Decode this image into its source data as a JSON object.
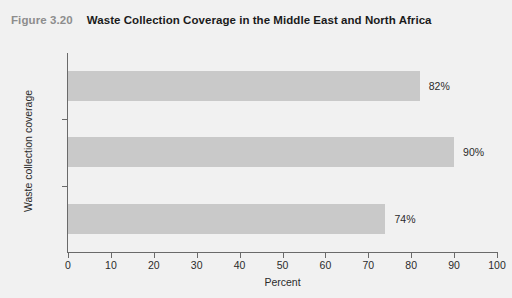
{
  "figure": {
    "number_label": "Figure 3.20",
    "title": "Waste Collection Coverage in the Middle East and North Africa"
  },
  "colors": {
    "bar_fill": "#c9c9c9",
    "axis": "#6a6a6a",
    "page_background": "#f1f1f1",
    "figure_number_text": "#8d8d8d",
    "title_text": "#1b1b1b"
  },
  "chart_data": {
    "type": "bar",
    "orientation": "horizontal",
    "title": "Waste Collection Coverage in the Middle East and North Africa",
    "categories": [
      "Total",
      "Urban",
      "Rural"
    ],
    "values": [
      82,
      90,
      74
    ],
    "value_labels": [
      "82%",
      "90%",
      "74%"
    ],
    "xlabel": "Percent",
    "ylabel": "Waste collection coverage",
    "xlim": [
      0,
      100
    ],
    "xticks": [
      0,
      10,
      20,
      30,
      40,
      50,
      60,
      70,
      80,
      90,
      100
    ],
    "xtick_labels": [
      "0",
      "10",
      "20",
      "30",
      "40",
      "50",
      "60",
      "70",
      "80",
      "90",
      "100"
    ],
    "grid": false,
    "legend": false
  }
}
